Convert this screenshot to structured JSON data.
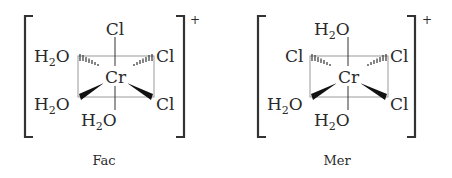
{
  "figure": {
    "isomers": [
      {
        "caption": "Fac",
        "charge": "+",
        "center": "Cr",
        "ligands": {
          "top": "Cl",
          "upper_left": "H2O",
          "upper_right": "Cl",
          "lower_left": "H2O",
          "lower_right": "Cl",
          "bottom": "H2O"
        }
      },
      {
        "caption": "Mer",
        "charge": "+",
        "center": "Cr",
        "ligands": {
          "top": "H2O",
          "upper_left": "Cl",
          "upper_right": "Cl",
          "lower_left": "H2O",
          "lower_right": "Cl",
          "bottom": "H2O"
        }
      }
    ],
    "labels": {
      "water_main": "H",
      "water_sub": "2",
      "water_tail": "O",
      "chloride": "Cl",
      "metal": "Cr"
    }
  }
}
